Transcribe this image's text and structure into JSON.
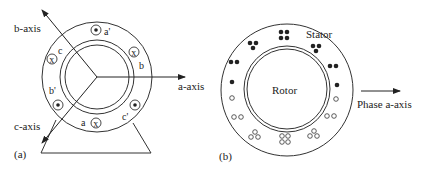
{
  "figure_a": {
    "panel_label": "(a)",
    "axes": {
      "a_axis": "a-axis",
      "b_axis": "b-axis",
      "c_axis": "c-axis"
    },
    "conductors": [
      {
        "label": "a'",
        "symbol": "dot"
      },
      {
        "label": "b",
        "symbol": "x"
      },
      {
        "label": "c'",
        "symbol": "dot"
      },
      {
        "label": "a",
        "symbol": "x"
      },
      {
        "label": "b'",
        "symbol": "dot"
      },
      {
        "label": "c",
        "symbol": "x"
      }
    ],
    "x_glyph": "x"
  },
  "figure_b": {
    "panel_label": "(b)",
    "stator_label": "Stator",
    "rotor_label": "Rotor",
    "axis_label": "Phase a-axis"
  },
  "colors": {
    "line": "#333333",
    "filled": "#222222",
    "background": "#ffffff"
  }
}
